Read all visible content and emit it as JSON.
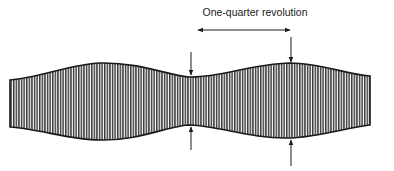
{
  "annotation": {
    "label": "One-quarter revolution"
  },
  "colors": {
    "ink": "#1a1a1a",
    "band_fill": "#7a7a7a",
    "background": "#ffffff"
  }
}
